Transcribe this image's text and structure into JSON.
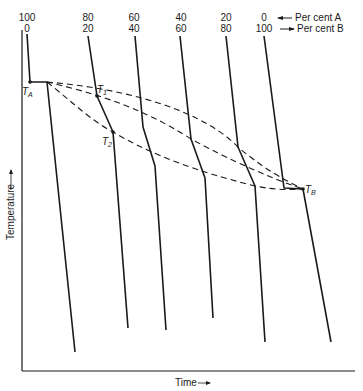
{
  "diagram": {
    "type": "cooling-curves",
    "y_axis_label": "Temperature",
    "x_axis_label": "Time",
    "legend": {
      "row_a": "Per cent A",
      "row_b": "Per cent B"
    },
    "compositions": [
      {
        "a": "100",
        "b": "0"
      },
      {
        "a": "80",
        "b": "20"
      },
      {
        "a": "60",
        "b": "40"
      },
      {
        "a": "40",
        "b": "60"
      },
      {
        "a": "20",
        "b": "80"
      },
      {
        "a": "0",
        "b": "100"
      }
    ],
    "points": {
      "ta": "T",
      "ta_sub": "A",
      "t1": "T",
      "t1_sub": "1",
      "t2": "T",
      "t2_sub": "2",
      "tb": "T",
      "tb_sub": "B"
    },
    "curves_description": "Dashed upper curve = liquidus (from T_A through T_1 to T_B); dashed lower curve = solidus (from T_A through T_2 to T_B)",
    "colors": {
      "line": "#1a1a1a",
      "background": "#ffffff"
    }
  }
}
